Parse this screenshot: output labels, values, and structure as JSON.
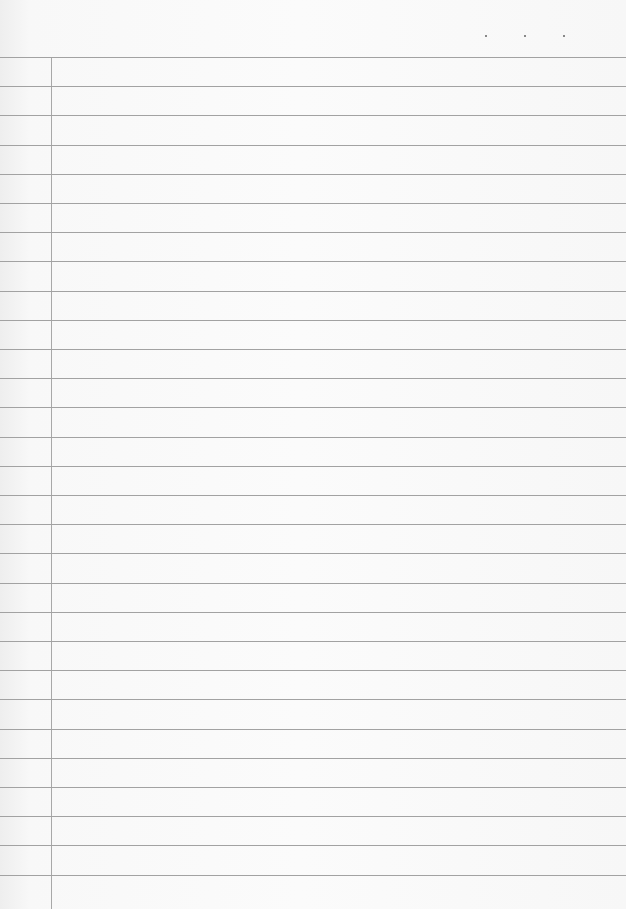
{
  "paper": {
    "type": "lined-notebook-paper",
    "line_count": 29,
    "first_line_y": 57,
    "line_spacing": 29.2,
    "margin_x": 51,
    "line_color": "#a2a2a2",
    "background": "#f8f8f8",
    "dots_x": [
      485,
      524,
      563
    ]
  }
}
